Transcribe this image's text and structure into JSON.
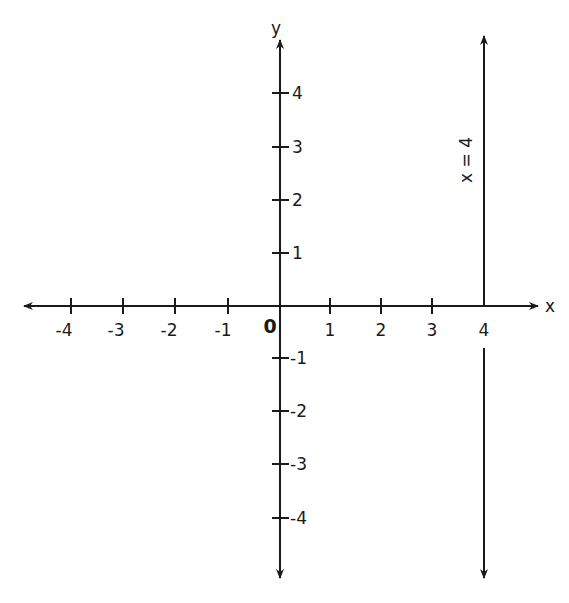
{
  "diagram": {
    "type": "coordinate-plane",
    "axes": {
      "x_label": "x",
      "y_label": "y",
      "origin_label": "0",
      "x_ticks": [
        "-4",
        "-3",
        "-2",
        "-1",
        "1",
        "2",
        "3",
        "4"
      ],
      "y_ticks": [
        "4",
        "3",
        "2",
        "1",
        "-1",
        "-2",
        "-3",
        "-4"
      ]
    },
    "line": {
      "equation_label": "x = 4",
      "x_value": 4,
      "orientation": "vertical"
    },
    "colors": {
      "ink": "#1a1a1a",
      "background": "#ffffff"
    }
  }
}
